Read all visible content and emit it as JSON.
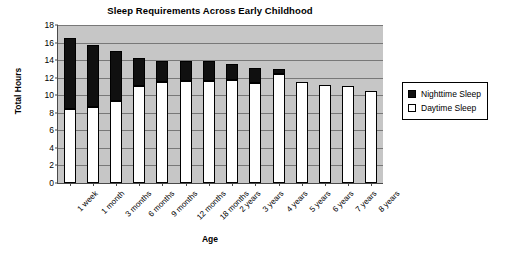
{
  "chart_data": {
    "type": "bar",
    "subtype": "stacked",
    "title": "Sleep Requirements Across Early Childhood",
    "xlabel": "Age",
    "ylabel": "Total Hours",
    "ylim": [
      0,
      18
    ],
    "ytick_step": 2,
    "yticks": [
      0,
      2,
      4,
      6,
      8,
      10,
      12,
      14,
      16,
      18
    ],
    "grid": true,
    "legend_position": "right",
    "categories": [
      "1 week",
      "1 month",
      "3 months",
      "6 months",
      "9 months",
      "12 months",
      "18 months",
      "2 years",
      "3 years",
      "4 years",
      "5 years",
      "6 years",
      "7 years",
      "8 years"
    ],
    "series": [
      {
        "name": "Daytime Sleep",
        "color": "#ffffff",
        "values": [
          8.4,
          8.7,
          9.4,
          11.1,
          11.5,
          11.6,
          11.6,
          11.7,
          11.4,
          12.4,
          11.5,
          11.2,
          11.0,
          10.5
        ]
      },
      {
        "name": "Nighttime Sleep",
        "color": "#101010",
        "values": [
          8.1,
          7.0,
          5.6,
          3.2,
          2.4,
          2.3,
          2.3,
          1.9,
          1.7,
          0.6,
          0.0,
          0.0,
          0.0,
          0.0
        ]
      }
    ],
    "totals": [
      16.5,
      15.7,
      15.0,
      14.3,
      13.9,
      13.9,
      13.9,
      13.6,
      13.1,
      13.0,
      11.5,
      11.2,
      11.0,
      10.5
    ],
    "colors": {
      "plot_background": "#c6c6c6",
      "gridline": "#787878",
      "axis": "#4a4a4a",
      "nighttime": "#101010",
      "daytime": "#ffffff"
    }
  },
  "legend": {
    "items": [
      {
        "label": "Nighttime Sleep",
        "swatch": "night"
      },
      {
        "label": "Daytime Sleep",
        "swatch": "day"
      }
    ]
  }
}
